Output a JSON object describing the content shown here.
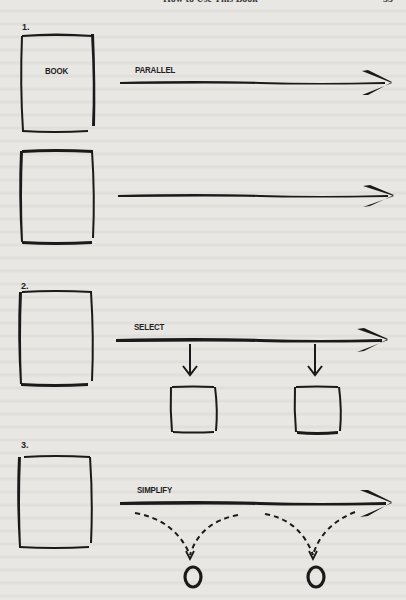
{
  "header": {
    "running_title": "How to Use This Book",
    "page_number": "55"
  },
  "figure": {
    "steps": [
      {
        "number": "1.",
        "rows": [
          {
            "box_label": "BOOK",
            "arrow_label": "PARALLEL"
          },
          {
            "box_label": "",
            "arrow_label": ""
          }
        ]
      },
      {
        "number": "2.",
        "box_label": "",
        "arrow_label": "SELECT",
        "outputs": [
          "selected-box",
          "selected-box"
        ]
      },
      {
        "number": "3.",
        "box_label": "",
        "arrow_label": "SIMPLIFY",
        "outputs": [
          "O",
          "O"
        ]
      }
    ]
  },
  "colors": {
    "paper": "#e9e7e3",
    "ink": "#1a1a1a"
  }
}
